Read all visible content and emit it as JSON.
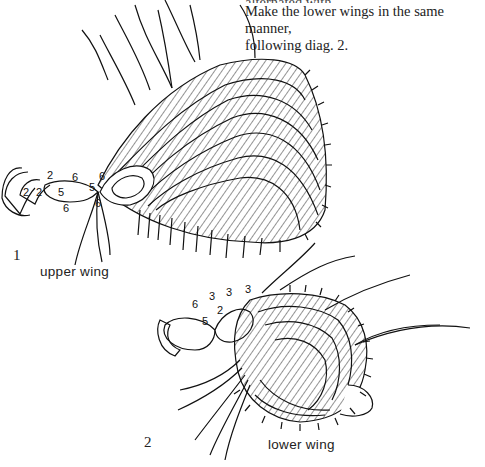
{
  "caption": {
    "line0": "alternated with ...",
    "line1": "Make the lower wings in the same manner,",
    "line2": "following diag. 2."
  },
  "figures": [
    {
      "number": "1",
      "label": "upper wing",
      "stitch_counts": [
        "2",
        "2",
        "2",
        "6",
        "5",
        "5",
        "6",
        "6",
        "6"
      ]
    },
    {
      "number": "2",
      "label": "lower wing",
      "stitch_counts": [
        "6",
        "3",
        "3",
        "3",
        "5",
        "2"
      ]
    }
  ],
  "colors": {
    "ink": "#111111",
    "paper": "#ffffff"
  }
}
